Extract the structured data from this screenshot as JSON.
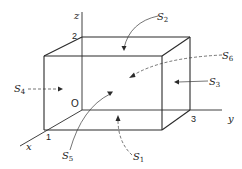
{
  "diagram": {
    "type": "3d-box-surfaces",
    "axes": {
      "x": {
        "label": "x",
        "tick": "1"
      },
      "y": {
        "label": "y",
        "tick": "3"
      },
      "z": {
        "label": "z",
        "tick": "2"
      },
      "origin": "O"
    },
    "surfaces": [
      {
        "id": "S1",
        "base": "S",
        "sub": "1",
        "arrow": "dashed",
        "face": "bottom"
      },
      {
        "id": "S2",
        "base": "S",
        "sub": "2",
        "arrow": "solid",
        "face": "top"
      },
      {
        "id": "S3",
        "base": "S",
        "sub": "3",
        "arrow": "solid",
        "face": "right"
      },
      {
        "id": "S4",
        "base": "S",
        "sub": "4",
        "arrow": "dashed",
        "face": "left"
      },
      {
        "id": "S5",
        "base": "S",
        "sub": "5",
        "arrow": "solid",
        "face": "front"
      },
      {
        "id": "S6",
        "base": "S",
        "sub": "6",
        "arrow": "dashed",
        "face": "back"
      }
    ]
  }
}
